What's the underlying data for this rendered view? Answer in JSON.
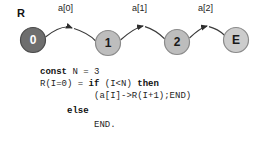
{
  "diagram": {
    "title_label": "R",
    "nodes": [
      {
        "id": "n0",
        "label": "0",
        "cx": 33,
        "cy": 40,
        "r": 12.5,
        "fill": "#6e6e6e",
        "text_color": "#ffffff",
        "stroke": "#4a4a4a"
      },
      {
        "id": "n1",
        "label": "1",
        "cx": 108,
        "cy": 43,
        "r": 12.5,
        "fill": "#bdbdbd",
        "text_color": "#1a1a1a",
        "stroke": "#8a8a8a"
      },
      {
        "id": "n2",
        "label": "2",
        "cx": 177,
        "cy": 42,
        "r": 12.5,
        "fill": "#bdbdbd",
        "text_color": "#1a1a1a",
        "stroke": "#8a8a8a"
      },
      {
        "id": "nE",
        "label": "E",
        "cx": 236,
        "cy": 40,
        "r": 12.5,
        "fill": "#cccccc",
        "text_color": "#1a1a1a",
        "stroke": "#8a8a8a"
      }
    ],
    "edges": [
      {
        "id": "e0",
        "label": "a[0]",
        "from": "n0",
        "to": "n1",
        "label_x": 58,
        "label_y": 7
      },
      {
        "id": "e1",
        "label": "a[1]",
        "from": "n1",
        "to": "n2",
        "label_x": 132,
        "label_y": 7
      },
      {
        "id": "e2",
        "label": "a[2]",
        "from": "n2",
        "to": "nE",
        "label_x": 198,
        "label_y": 7
      }
    ],
    "root_label_x": 17,
    "root_label_y": 14,
    "edge_color": "#3a3a3a"
  },
  "code": {
    "lines": [
      {
        "x": 40,
        "y": 2,
        "tokens": [
          {
            "t": "const",
            "bold": true
          },
          {
            "t": " N = 3",
            "bold": false
          }
        ]
      },
      {
        "x": 40,
        "y": 14.2,
        "tokens": [
          {
            "t": "R(I=0) = ",
            "bold": false
          },
          {
            "t": "if",
            "bold": true
          },
          {
            "t": " (I<N) ",
            "bold": false
          },
          {
            "t": "then",
            "bold": true
          }
        ]
      },
      {
        "x": 94,
        "y": 26.4,
        "tokens": [
          {
            "t": "(a[I]->R(I+1);END)",
            "bold": false
          }
        ]
      },
      {
        "x": 67,
        "y": 40.6,
        "tokens": [
          {
            "t": "else",
            "bold": true
          }
        ]
      },
      {
        "x": 94,
        "y": 54.8,
        "tokens": [
          {
            "t": "END.",
            "bold": false
          }
        ]
      }
    ]
  }
}
